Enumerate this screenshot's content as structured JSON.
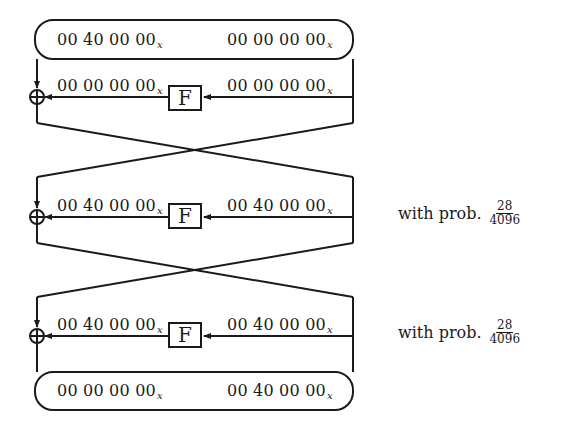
{
  "diagram": {
    "type": "Feistel differential characteristic (3 rounds)",
    "subscript": "x",
    "input": {
      "left": "00 40 00 00",
      "right": "00 00 00 00"
    },
    "rounds": [
      {
        "f_label": "F",
        "f_input": "00 00 00 00",
        "f_output": "00 00 00 00",
        "probability": null
      },
      {
        "f_label": "F",
        "f_input": "00 40 00 00",
        "f_output": "00 40 00 00",
        "probability": {
          "prefix": "with prob.",
          "numerator": "28",
          "denominator": "4096"
        }
      },
      {
        "f_label": "F",
        "f_input": "00 40 00 00",
        "f_output": "00 40 00 00",
        "probability": {
          "prefix": "with prob.",
          "numerator": "28",
          "denominator": "4096"
        }
      }
    ],
    "output": {
      "left": "00 00 00 00",
      "right": "00 40 00 00"
    },
    "colors": {
      "ink": "#1a1a1a",
      "background": "#ffffff"
    }
  }
}
